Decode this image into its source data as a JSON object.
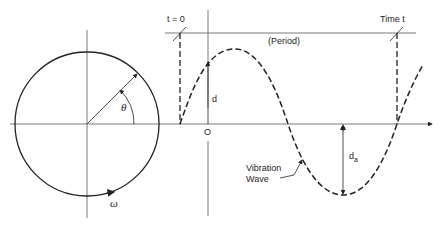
{
  "diagram": {
    "colors": {
      "line": "#222222",
      "axis": "#555555",
      "background": "#ffffff"
    },
    "labels": {
      "t0": "t = 0",
      "time_t": "Time t",
      "period": "(Period)",
      "d": "d",
      "origin": "O",
      "da_main": "d",
      "da_sub": "a",
      "theta": "θ",
      "omega": "ω",
      "vibration_line1": "Vibration",
      "vibration_line2": "Wave"
    },
    "elements": [
      {
        "name": "circle",
        "center": [
          87,
          124
        ],
        "radius": 72
      },
      {
        "name": "radius-vector",
        "angle_deg": 45
      },
      {
        "name": "sine-wave",
        "style": "dashed"
      }
    ]
  }
}
